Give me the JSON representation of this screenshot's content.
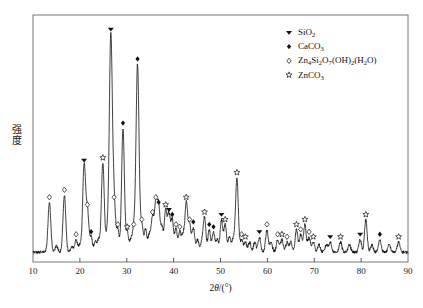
{
  "chart_data": {
    "type": "line",
    "title": "",
    "xlabel": "2θ/(°)",
    "ylabel": "强度",
    "xlim": [
      10,
      90
    ],
    "ylim": [
      0,
      100
    ],
    "grid": false,
    "xticks": [
      10,
      20,
      30,
      40,
      50,
      60,
      70,
      80,
      90
    ],
    "xticklabels": [
      "10",
      "20",
      "30",
      "40",
      "50",
      "60",
      "70",
      "80",
      "90"
    ],
    "yticks": [],
    "yticklabels": [],
    "legend_position": "top-right",
    "legend": [
      {
        "label": "SiO2",
        "html": "SiO<sub>2</sub>",
        "marker": "filled-triangle-down"
      },
      {
        "label": "CaCO3",
        "html": "CaCO<sub>3</sub>",
        "marker": "filled-diamond"
      },
      {
        "label": "Zn4Si2O7(OH)2(H2O)",
        "html": "Zn<sub>4</sub>Si<sub>2</sub>O<sub>7</sub>(OH)<sub>2</sub>(H<sub>2</sub>O)",
        "marker": "open-diamond"
      },
      {
        "label": "ZnCO3",
        "html": "ZnCO<sub>3</sub>",
        "marker": "star"
      }
    ],
    "series": [
      {
        "name": "XRD intensity",
        "baseline": 4,
        "peaks": [
          {
            "x": 13.5,
            "h": 20,
            "w": 0.3,
            "marker": "open-diamond"
          },
          {
            "x": 15.0,
            "h": 2.5,
            "w": 0.3,
            "marker": null
          },
          {
            "x": 16.7,
            "h": 23,
            "w": 0.3,
            "marker": "open-diamond"
          },
          {
            "x": 18.3,
            "h": 2.5,
            "w": 0.28,
            "marker": null
          },
          {
            "x": 19.2,
            "h": 5,
            "w": 0.28,
            "marker": "open-diamond"
          },
          {
            "x": 20.0,
            "h": 3,
            "w": 0.28,
            "marker": null
          },
          {
            "x": 20.9,
            "h": 35,
            "w": 0.3,
            "marker": "filled-triangle-down"
          },
          {
            "x": 21.6,
            "h": 17,
            "w": 0.3,
            "marker": "open-diamond"
          },
          {
            "x": 22.4,
            "h": 6,
            "w": 0.28,
            "marker": "filled-diamond"
          },
          {
            "x": 23.3,
            "h": 4,
            "w": 0.28,
            "marker": null
          },
          {
            "x": 24.0,
            "h": 5,
            "w": 0.28,
            "marker": null
          },
          {
            "x": 24.9,
            "h": 36,
            "w": 0.3,
            "marker": "star"
          },
          {
            "x": 25.8,
            "h": 7,
            "w": 0.28,
            "marker": null
          },
          {
            "x": 26.6,
            "h": 88,
            "w": 0.32,
            "marker": "filled-triangle-down"
          },
          {
            "x": 27.3,
            "h": 20,
            "w": 0.3,
            "marker": "open-diamond"
          },
          {
            "x": 28.1,
            "h": 9,
            "w": 0.28,
            "marker": "open-diamond"
          },
          {
            "x": 29.2,
            "h": 50,
            "w": 0.3,
            "marker": "filled-diamond"
          },
          {
            "x": 30.1,
            "h": 8,
            "w": 0.28,
            "marker": "star"
          },
          {
            "x": 30.9,
            "h": 5,
            "w": 0.28,
            "marker": null
          },
          {
            "x": 31.5,
            "h": 9,
            "w": 0.28,
            "marker": "open-diamond"
          },
          {
            "x": 32.3,
            "h": 76,
            "w": 0.32,
            "marker": "filled-diamond"
          },
          {
            "x": 33.2,
            "h": 11,
            "w": 0.28,
            "marker": "open-diamond"
          },
          {
            "x": 34.0,
            "h": 9,
            "w": 0.28,
            "marker": null
          },
          {
            "x": 34.8,
            "h": 7,
            "w": 0.28,
            "marker": null
          },
          {
            "x": 35.5,
            "h": 14,
            "w": 0.28,
            "marker": "open-diamond"
          },
          {
            "x": 36.2,
            "h": 20,
            "w": 0.28,
            "marker": "open-diamond"
          },
          {
            "x": 36.8,
            "h": 18,
            "w": 0.28,
            "marker": "filled-diamond"
          },
          {
            "x": 37.5,
            "h": 10,
            "w": 0.28,
            "marker": null
          },
          {
            "x": 38.3,
            "h": 17,
            "w": 0.28,
            "marker": "star"
          },
          {
            "x": 39.0,
            "h": 15,
            "w": 0.28,
            "marker": "filled-triangle-down"
          },
          {
            "x": 39.7,
            "h": 13,
            "w": 0.28,
            "marker": "filled-diamond"
          },
          {
            "x": 40.5,
            "h": 9,
            "w": 0.28,
            "marker": "open-diamond"
          },
          {
            "x": 41.3,
            "h": 8,
            "w": 0.28,
            "marker": "open-diamond"
          },
          {
            "x": 42.0,
            "h": 7,
            "w": 0.28,
            "marker": null
          },
          {
            "x": 42.7,
            "h": 20,
            "w": 0.28,
            "marker": "star"
          },
          {
            "x": 43.4,
            "h": 11,
            "w": 0.28,
            "marker": "open-diamond"
          },
          {
            "x": 44.2,
            "h": 10,
            "w": 0.28,
            "marker": "filled-diamond"
          },
          {
            "x": 45.1,
            "h": 5,
            "w": 0.28,
            "marker": null
          },
          {
            "x": 46.0,
            "h": 4,
            "w": 0.28,
            "marker": null
          },
          {
            "x": 46.6,
            "h": 14,
            "w": 0.28,
            "marker": "star"
          },
          {
            "x": 47.6,
            "h": 9,
            "w": 0.28,
            "marker": "filled-diamond"
          },
          {
            "x": 48.5,
            "h": 8,
            "w": 0.28,
            "marker": "filled-diamond"
          },
          {
            "x": 49.3,
            "h": 5,
            "w": 0.28,
            "marker": null
          },
          {
            "x": 50.2,
            "h": 13,
            "w": 0.28,
            "marker": "filled-triangle-down"
          },
          {
            "x": 51.0,
            "h": 11,
            "w": 0.28,
            "marker": "star"
          },
          {
            "x": 51.9,
            "h": 6,
            "w": 0.28,
            "marker": null
          },
          {
            "x": 52.7,
            "h": 5,
            "w": 0.28,
            "marker": null
          },
          {
            "x": 53.5,
            "h": 30,
            "w": 0.3,
            "marker": "star"
          },
          {
            "x": 54.5,
            "h": 5,
            "w": 0.28,
            "marker": "open-diamond"
          },
          {
            "x": 55.3,
            "h": 4,
            "w": 0.28,
            "marker": "star"
          },
          {
            "x": 56.2,
            "h": 4,
            "w": 0.28,
            "marker": null
          },
          {
            "x": 57.3,
            "h": 4,
            "w": 0.28,
            "marker": null
          },
          {
            "x": 58.3,
            "h": 6,
            "w": 0.28,
            "marker": "filled-triangle-down"
          },
          {
            "x": 59.9,
            "h": 9,
            "w": 0.28,
            "marker": "open-diamond"
          },
          {
            "x": 60.8,
            "h": 4,
            "w": 0.28,
            "marker": null
          },
          {
            "x": 62.2,
            "h": 5,
            "w": 0.28,
            "marker": "open-diamond"
          },
          {
            "x": 63.1,
            "h": 5,
            "w": 0.28,
            "marker": "star"
          },
          {
            "x": 64.2,
            "h": 4,
            "w": 0.28,
            "marker": "open-diamond"
          },
          {
            "x": 65.0,
            "h": 4,
            "w": 0.28,
            "marker": null
          },
          {
            "x": 66.2,
            "h": 9,
            "w": 0.28,
            "marker": "star"
          },
          {
            "x": 67.1,
            "h": 7,
            "w": 0.28,
            "marker": "open-diamond"
          },
          {
            "x": 68.0,
            "h": 11,
            "w": 0.28,
            "marker": "star"
          },
          {
            "x": 68.9,
            "h": 6,
            "w": 0.28,
            "marker": "open-diamond"
          },
          {
            "x": 69.8,
            "h": 4,
            "w": 0.28,
            "marker": "star"
          },
          {
            "x": 71.0,
            "h": 3,
            "w": 0.28,
            "marker": null
          },
          {
            "x": 72.6,
            "h": 3,
            "w": 0.28,
            "marker": null
          },
          {
            "x": 73.4,
            "h": 4,
            "w": 0.28,
            "marker": "filled-triangle-down"
          },
          {
            "x": 75.6,
            "h": 4,
            "w": 0.28,
            "marker": "star"
          },
          {
            "x": 77.5,
            "h": 3,
            "w": 0.28,
            "marker": null
          },
          {
            "x": 79.8,
            "h": 5,
            "w": 0.28,
            "marker": "filled-triangle-down"
          },
          {
            "x": 81.0,
            "h": 13,
            "w": 0.28,
            "marker": "star"
          },
          {
            "x": 82.3,
            "h": 3,
            "w": 0.28,
            "marker": null
          },
          {
            "x": 84.0,
            "h": 5,
            "w": 0.28,
            "marker": "filled-diamond"
          },
          {
            "x": 86.0,
            "h": 3,
            "w": 0.28,
            "marker": null
          },
          {
            "x": 88.0,
            "h": 4,
            "w": 0.28,
            "marker": "star"
          }
        ]
      }
    ]
  }
}
